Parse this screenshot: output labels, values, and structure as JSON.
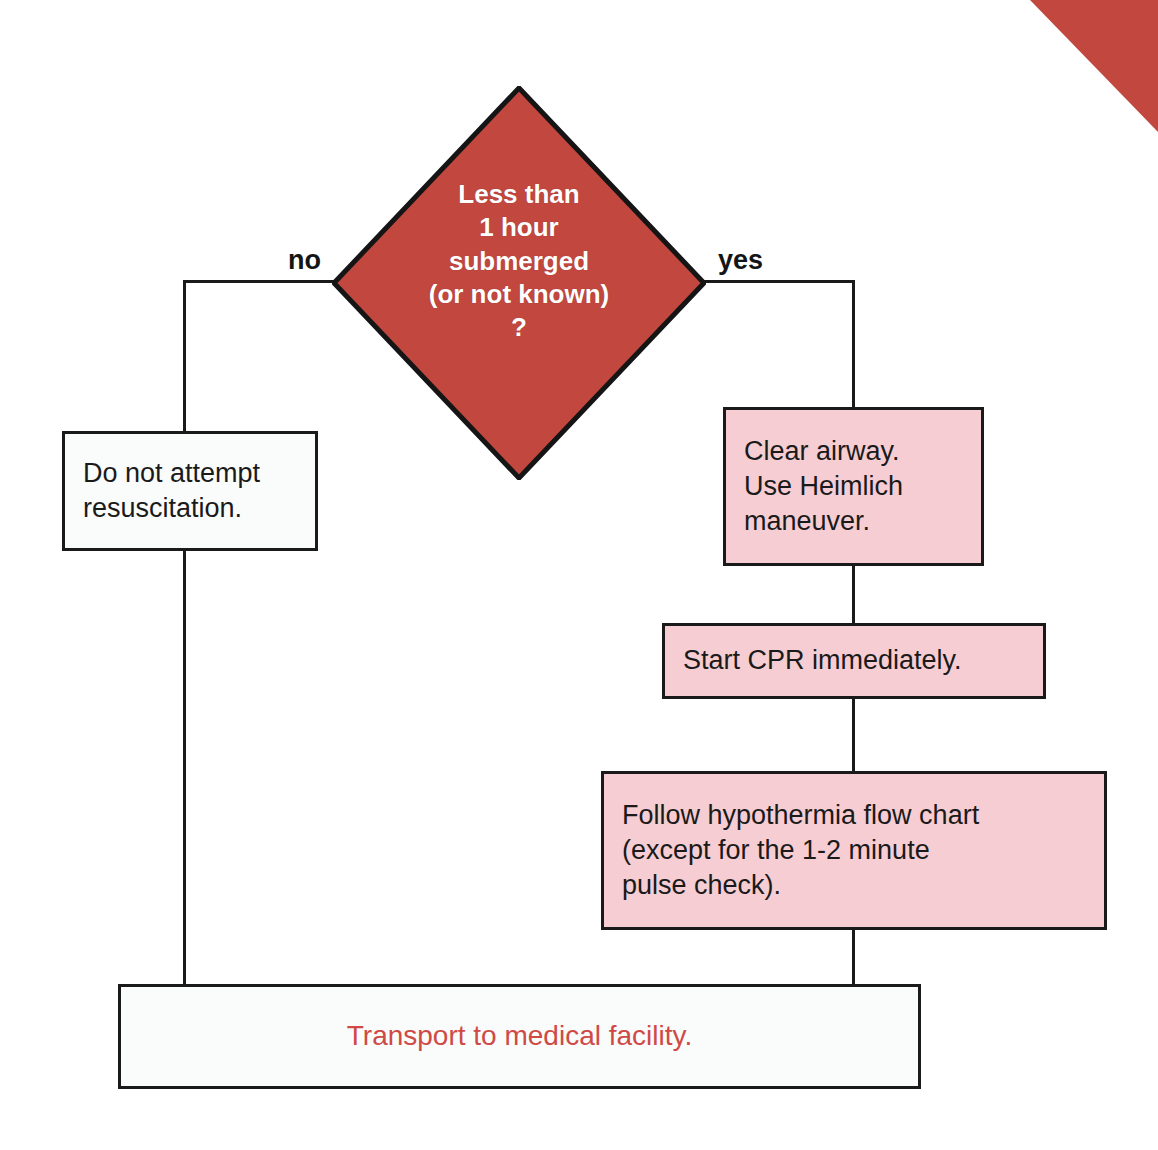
{
  "diagram": {
    "colors": {
      "decision_fill": "#c2473f",
      "process_fill": "#f6cdd2",
      "terminal_fill": "#fafbfb",
      "outline": "#1a1a1a",
      "decision_text": "#ffffff",
      "terminal_text": "#cf4a45",
      "corner_accent": "#c2473f"
    },
    "decision": {
      "id": "submersion-time-decision",
      "shape": "diamond",
      "text": "Less than\n1 hour\nsubmerged\n(or not known)\n?"
    },
    "branches": {
      "no_label": "no",
      "yes_label": "yes"
    },
    "nodes": [
      {
        "id": "do-not-attempt-resuscitation",
        "shape": "rectangle",
        "fill": "white",
        "branch": "no",
        "text": "Do not attempt\nresuscitation."
      },
      {
        "id": "clear-airway",
        "shape": "rectangle",
        "fill": "pink",
        "branch": "yes",
        "step": 1,
        "text": "Clear airway.\nUse Heimlich\nmaneuver."
      },
      {
        "id": "start-cpr",
        "shape": "rectangle",
        "fill": "pink",
        "branch": "yes",
        "step": 2,
        "text": "Start CPR immediately."
      },
      {
        "id": "follow-hypothermia-flow-chart",
        "shape": "rectangle",
        "fill": "pink",
        "branch": "yes",
        "step": 3,
        "text": "Follow hypothermia flow chart\n(except for the 1-2 minute\npulse check)."
      },
      {
        "id": "transport-to-medical-facility",
        "shape": "rectangle",
        "fill": "white",
        "branch": "merge",
        "text": "Transport to medical facility."
      }
    ],
    "corner_accent": {
      "name": "corner-triangle",
      "position": "top-right"
    }
  }
}
